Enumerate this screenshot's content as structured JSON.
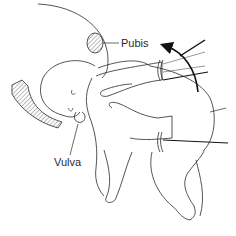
{
  "figure": {
    "type": "obstetric line illustration",
    "labels": {
      "pubis": "Pubis",
      "vulva": "Vulva"
    },
    "colors": {
      "line": "#2a2a2a",
      "hatch": "#555555",
      "background": "#ffffff"
    }
  }
}
